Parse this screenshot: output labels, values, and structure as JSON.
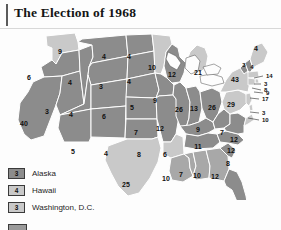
{
  "header": {
    "title": "The Election of 1968"
  },
  "map": {
    "colors": {
      "nixon": "#8c8c8c",
      "humphrey": "#c9c9c9",
      "wallace": "#a8a8a8",
      "border": "#ffffff",
      "outline": "#4a4a4a",
      "background": "#fdfdfd",
      "lakes": "#fdfdfd",
      "label": "#101010"
    },
    "states": [
      {
        "code": "WA",
        "name": "Washington",
        "votes": "9",
        "shade": "humphrey",
        "lx": 60,
        "ly": 22,
        "size": "md"
      },
      {
        "code": "OR",
        "name": "Oregon",
        "votes": "6",
        "shade": "nixon",
        "lx": 29,
        "ly": 48,
        "size": "md"
      },
      {
        "code": "CA",
        "name": "California",
        "votes": "40",
        "shade": "nixon",
        "lx": 24,
        "ly": 94,
        "size": "md"
      },
      {
        "code": "NV",
        "name": "Nevada",
        "votes": "3",
        "shade": "nixon",
        "lx": 47,
        "ly": 82,
        "size": "md"
      },
      {
        "code": "ID",
        "name": "Idaho",
        "votes": "4",
        "shade": "nixon",
        "lx": 70,
        "ly": 53,
        "size": "md"
      },
      {
        "code": "MT",
        "name": "Montana",
        "votes": "4",
        "shade": "nixon",
        "lx": 104,
        "ly": 27,
        "size": "md"
      },
      {
        "code": "WY",
        "name": "Wyoming",
        "votes": "3",
        "shade": "nixon",
        "lx": 101,
        "ly": 57,
        "size": "md"
      },
      {
        "code": "UT",
        "name": "Utah",
        "votes": "4",
        "shade": "nixon",
        "lx": 71,
        "ly": 85,
        "size": "md"
      },
      {
        "code": "CO",
        "name": "Colorado",
        "votes": "6",
        "shade": "nixon",
        "lx": 104,
        "ly": 87,
        "size": "md"
      },
      {
        "code": "AZ",
        "name": "Arizona",
        "votes": "5",
        "shade": "nixon",
        "lx": 73,
        "ly": 122,
        "size": "md"
      },
      {
        "code": "NM",
        "name": "New Mexico",
        "votes": "4",
        "shade": "nixon",
        "lx": 106,
        "ly": 124,
        "size": "md"
      },
      {
        "code": "ND",
        "name": "North Dakota",
        "votes": "4",
        "shade": "nixon",
        "lx": 129,
        "ly": 27,
        "size": "md"
      },
      {
        "code": "SD",
        "name": "South Dakota",
        "votes": "4",
        "shade": "nixon",
        "lx": 129,
        "ly": 52,
        "size": "md"
      },
      {
        "code": "NE",
        "name": "Nebraska",
        "votes": "5",
        "shade": "nixon",
        "lx": 132,
        "ly": 78,
        "size": "md"
      },
      {
        "code": "KS",
        "name": "Kansas",
        "votes": "7",
        "shade": "nixon",
        "lx": 136,
        "ly": 103,
        "size": "md"
      },
      {
        "code": "OK",
        "name": "Oklahoma",
        "votes": "8",
        "shade": "nixon",
        "lx": 139,
        "ly": 125,
        "size": "md"
      },
      {
        "code": "TX",
        "name": "Texas",
        "votes": "25",
        "shade": "humphrey",
        "lx": 126,
        "ly": 155,
        "size": "md"
      },
      {
        "code": "MN",
        "name": "Minnesota",
        "votes": "10",
        "shade": "humphrey",
        "lx": 152,
        "ly": 38,
        "size": "md"
      },
      {
        "code": "IA",
        "name": "Iowa",
        "votes": "9",
        "shade": "nixon",
        "lx": 155,
        "ly": 71,
        "size": "md"
      },
      {
        "code": "MO",
        "name": "Missouri",
        "votes": "12",
        "shade": "nixon",
        "lx": 160,
        "ly": 99,
        "size": "md"
      },
      {
        "code": "AR",
        "name": "Arkansas",
        "votes": "6",
        "shade": "humphrey",
        "lx": 165,
        "ly": 125,
        "size": "md"
      },
      {
        "code": "LA",
        "name": "Louisiana",
        "votes": "10",
        "shade": "wallace",
        "lx": 166,
        "ly": 149,
        "size": "md"
      },
      {
        "code": "WI",
        "name": "Wisconsin",
        "votes": "12",
        "shade": "nixon",
        "lx": 172,
        "ly": 45,
        "size": "md"
      },
      {
        "code": "IL",
        "name": "Illinois",
        "votes": "26",
        "shade": "nixon",
        "lx": 179,
        "ly": 80,
        "size": "md"
      },
      {
        "code": "MS",
        "name": "Mississippi",
        "votes": "7",
        "shade": "wallace",
        "lx": 181,
        "ly": 145,
        "size": "md"
      },
      {
        "code": "MI",
        "name": "Michigan",
        "votes": "21",
        "shade": "humphrey",
        "lx": 198,
        "ly": 43,
        "size": "md"
      },
      {
        "code": "IN",
        "name": "Indiana",
        "votes": "13",
        "shade": "nixon",
        "lx": 194,
        "ly": 79,
        "size": "md"
      },
      {
        "code": "KY",
        "name": "Kentucky",
        "votes": "9",
        "shade": "nixon",
        "lx": 198,
        "ly": 100,
        "size": "md"
      },
      {
        "code": "TN",
        "name": "Tennessee",
        "votes": "11",
        "shade": "nixon",
        "lx": 198,
        "ly": 117,
        "size": "md"
      },
      {
        "code": "AL",
        "name": "Alabama",
        "votes": "10",
        "shade": "wallace",
        "lx": 197,
        "ly": 146,
        "size": "md"
      },
      {
        "code": "OH",
        "name": "Ohio",
        "votes": "26",
        "shade": "nixon",
        "lx": 212,
        "ly": 78,
        "size": "md"
      },
      {
        "code": "GA",
        "name": "Georgia",
        "votes": "12",
        "shade": "wallace",
        "lx": 215,
        "ly": 147,
        "size": "md"
      },
      {
        "code": "FL",
        "name": "Florida",
        "votes": "14",
        "shade": "nixon",
        "lx": 236,
        "ly": 175,
        "size": "md"
      },
      {
        "code": "WV",
        "name": "West Virginia",
        "votes": "7",
        "shade": "nixon",
        "lx": 222,
        "ly": 103,
        "size": "md"
      },
      {
        "code": "SC",
        "name": "South Carolina",
        "votes": "8",
        "shade": "nixon",
        "lx": 228,
        "ly": 134,
        "size": "md"
      },
      {
        "code": "NC",
        "name": "North Carolina",
        "votes": "12",
        "shade": "nixon",
        "lx": 231,
        "ly": 121,
        "size": "md"
      },
      {
        "code": "VA",
        "name": "Virginia",
        "votes": "12",
        "shade": "nixon",
        "lx": 234,
        "ly": 110,
        "size": "md"
      },
      {
        "code": "PA",
        "name": "Pennsylvania",
        "votes": "29",
        "shade": "humphrey",
        "lx": 231,
        "ly": 75,
        "size": "md"
      },
      {
        "code": "NY",
        "name": "New York",
        "votes": "43",
        "shade": "humphrey",
        "lx": 235,
        "ly": 50,
        "size": "md"
      },
      {
        "code": "VT",
        "name": "Vermont",
        "votes": "3",
        "shade": "nixon",
        "lx": 244,
        "ly": 35,
        "size": "sm"
      },
      {
        "code": "NH",
        "name": "New Hampshire",
        "votes": "4",
        "shade": "nixon",
        "lx": 252,
        "ly": 37,
        "size": "sm"
      },
      {
        "code": "ME",
        "name": "Maine",
        "votes": "4",
        "shade": "humphrey",
        "lx": 256,
        "ly": 19,
        "size": "md"
      }
    ],
    "callouts": [
      {
        "code": "MA",
        "name": "Massachusetts",
        "votes": "14",
        "tx": 266,
        "ly": 46,
        "px": 254,
        "py": 48
      },
      {
        "code": "RI",
        "name": "Rhode Island",
        "votes": "3",
        "tx": 264,
        "ly": 54,
        "px": 254,
        "py": 54
      },
      {
        "code": "CT",
        "name": "Connecticut",
        "votes": "8",
        "tx": 264,
        "ly": 60,
        "px": 252,
        "py": 58
      },
      {
        "code": "NJ",
        "name": "New Jersey",
        "votes": "17",
        "tx": 262,
        "ly": 69,
        "px": 250,
        "py": 68
      },
      {
        "code": "DE",
        "name": "Delaware",
        "votes": "3",
        "tx": 262,
        "ly": 83,
        "px": 250,
        "py": 82
      },
      {
        "code": "MD",
        "name": "Maryland",
        "votes": "10",
        "tx": 262,
        "ly": 90,
        "px": 248,
        "py": 88
      },
      {
        "code": "NYsm",
        "name": "New York metro",
        "votes": "9",
        "tx": 266,
        "ly": 63,
        "px": 254,
        "py": 62
      }
    ]
  },
  "legend": {
    "items": [
      {
        "votes": "3",
        "label": "Alaska",
        "shade": "nixon"
      },
      {
        "votes": "4",
        "label": "Hawaii",
        "shade": "humphrey"
      },
      {
        "votes": "3",
        "label": "Washington, D.C.",
        "shade": "humphrey"
      }
    ]
  }
}
